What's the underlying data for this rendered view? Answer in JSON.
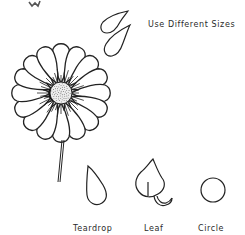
{
  "diagram": {
    "caption": "Use Different Sizes",
    "shapes": [
      {
        "name": "teardrop",
        "label": "Teardrop"
      },
      {
        "name": "leaf",
        "label": "Leaf"
      },
      {
        "name": "circle",
        "label": "Circle"
      }
    ],
    "illustration": "daisy-flower",
    "colors": {
      "ink": "#222222",
      "background": "#ffffff"
    }
  }
}
